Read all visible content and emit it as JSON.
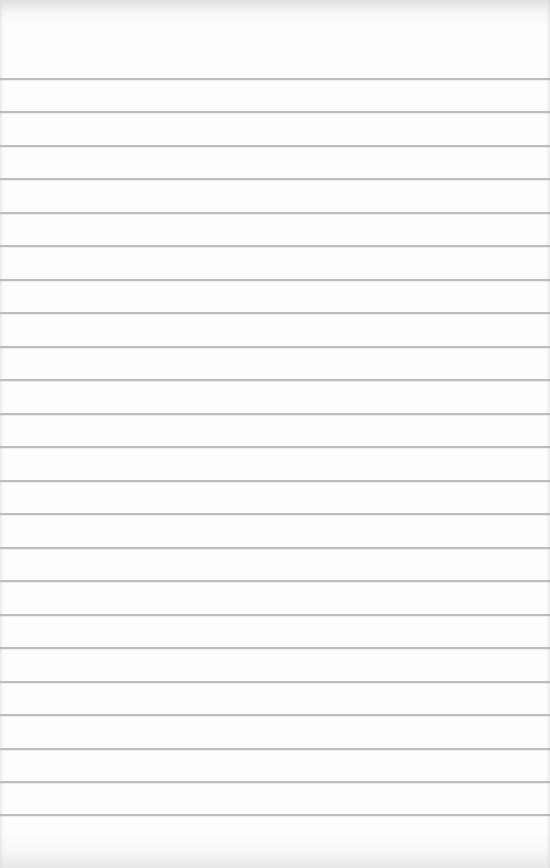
{
  "paper": {
    "type": "lined-paper",
    "background_color": "#fdfdfd",
    "line_color": "#bdbdbd",
    "line_thickness_px": 2,
    "line_count": 23,
    "line_positions_y": [
      79,
      112,
      146,
      179,
      213,
      246,
      280,
      313,
      347,
      380,
      414,
      447,
      481,
      514,
      548,
      581,
      615,
      648,
      682,
      715,
      749,
      782,
      815
    ]
  }
}
